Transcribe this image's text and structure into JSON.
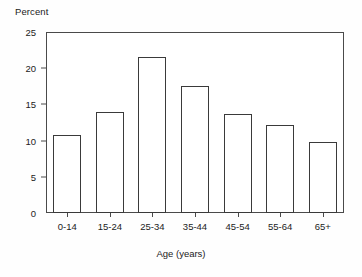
{
  "chart_data": {
    "type": "bar",
    "title": "",
    "xlabel": "Age (years)",
    "ylabel": "Percent",
    "categories": [
      "0-14",
      "15-24",
      "25-34",
      "35-44",
      "45-54",
      "55-64",
      "65+"
    ],
    "values": [
      10.8,
      14.0,
      21.5,
      17.5,
      13.7,
      12.1,
      9.8
    ],
    "ylim": [
      0,
      25
    ],
    "ytick_labels": [
      "0",
      "5",
      "10",
      "15",
      "20",
      "25"
    ],
    "ytick_values": [
      0,
      5,
      10,
      15,
      20,
      25
    ],
    "grid": false,
    "legend": "none",
    "bar_fill_color": "#ffffff",
    "bar_edge_color": "#3a3a3a",
    "axis_color": "#4a4a4a",
    "background_color": "#ffffff"
  }
}
